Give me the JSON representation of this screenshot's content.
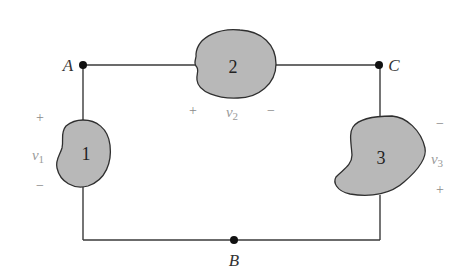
{
  "diagram": {
    "type": "circuit",
    "colors": {
      "wire": "#3a3a3a",
      "element_fill": "#b8b8b8",
      "element_stroke": "#2f2f2f",
      "node": "#111111",
      "sign": "#8a8a8a"
    },
    "nodes": [
      {
        "id": "A",
        "label": "A"
      },
      {
        "id": "B",
        "label": "B"
      },
      {
        "id": "C",
        "label": "C"
      }
    ],
    "elements": [
      {
        "id": "1",
        "label": "1",
        "voltage": {
          "symbol": "v",
          "sub": "1",
          "plus": "+",
          "minus": "−"
        }
      },
      {
        "id": "2",
        "label": "2",
        "voltage": {
          "symbol": "v",
          "sub": "2",
          "plus": "+",
          "minus": "−"
        }
      },
      {
        "id": "3",
        "label": "3",
        "voltage": {
          "symbol": "v",
          "sub": "3",
          "plus": "+",
          "minus": "−"
        }
      }
    ]
  }
}
